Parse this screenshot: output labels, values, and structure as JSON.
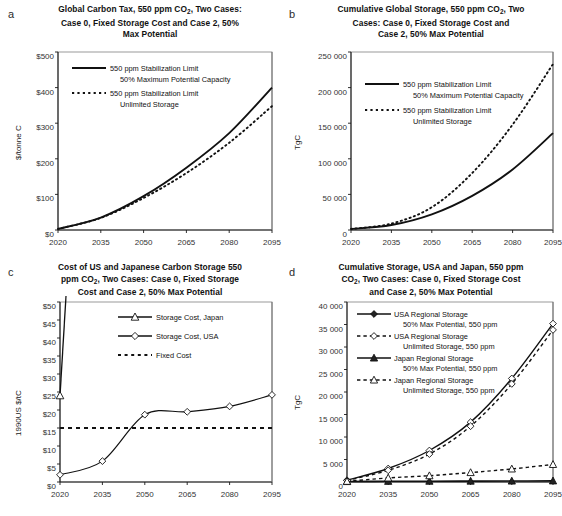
{
  "figure": {
    "panels": [
      "a",
      "b",
      "c",
      "d"
    ]
  },
  "panel_a": {
    "label": "a",
    "title_line1": "Global Carbon Tax, 550 ppm CO",
    "title_sub1": "2",
    "title_line1b": ", Two Cases:",
    "title_line2": "Case 0, Fixed Storage Cost and Case 2, 50%",
    "title_line3": "Max Potential",
    "ylabel": "$/tonne C",
    "yticks": [
      "$0",
      "$100",
      "$200",
      "$300",
      "$400",
      "$500"
    ],
    "xticks": [
      "2020",
      "2035",
      "2050",
      "2065",
      "2080",
      "2095"
    ],
    "legend": [
      {
        "l1": "550 ppm Stabilization Limit",
        "l2": "50% Maximum Potential Capacity",
        "style": "solid"
      },
      {
        "l1": "550 ppm Stabilization Limit",
        "l2": "Unlimited Storage",
        "style": "dashed"
      }
    ]
  },
  "panel_b": {
    "label": "b",
    "title_line1": "Cumulative Global Storage, 550 ppm CO",
    "title_sub1": "2",
    "title_line1b": ", Two",
    "title_line2": "Cases:  Case 0, Fixed Storage Cost and",
    "title_line3": "Case 2, 50% Max Potential",
    "ylabel": "TgC",
    "yticks": [
      "0",
      "50 000",
      "100 000",
      "150 000",
      "200 000",
      "250 000"
    ],
    "xticks": [
      "2020",
      "2035",
      "2050",
      "2065",
      "2080",
      "2095"
    ],
    "legend": [
      {
        "l1": "550 ppm Stabilization Limit",
        "l2": "50% Maximum Potential Capacity",
        "style": "solid"
      },
      {
        "l1": "550 ppm Stabilization Limit",
        "l2": "Unlimited Storage",
        "style": "dashed"
      }
    ]
  },
  "panel_c": {
    "label": "c",
    "title_line1": "Cost of US and Japanese Carbon Storage 550",
    "title_line2a": "ppm CO",
    "title_sub1": "2",
    "title_line2b": ", Two Cases:  Case 0, Fixed Storage",
    "title_line3": "Cost and Case 2, 50% Max Potential",
    "ylabel": "1990US $/tC",
    "yticks": [
      "$0",
      "$5",
      "$10",
      "$15",
      "$20",
      "$25",
      "$30",
      "$35",
      "$40",
      "$45",
      "$50"
    ],
    "xticks": [
      "2020",
      "2035",
      "2050",
      "2065",
      "2080",
      "2095"
    ],
    "legend": [
      {
        "l1": "Storage Cost, Japan",
        "style": "solid-triangle"
      },
      {
        "l1": "Storage Cost, USA",
        "style": "solid-diamond"
      },
      {
        "l1": "Fixed Cost",
        "style": "dashed"
      }
    ]
  },
  "panel_d": {
    "label": "d",
    "title_line1": "Cumulative Storage, USA and Japan, 550 ppm",
    "title_line2a": "CO",
    "title_sub1": "2",
    "title_line2b": ", Two Cases:  Case 0, Fixed Storage Cost",
    "title_line3": "and Case 2, 50% Max Potential",
    "ylabel": "TgC",
    "yticks": [
      "0",
      "5 000",
      "10 000",
      "15 000",
      "20 000",
      "25 000",
      "30 000",
      "35 000",
      "40 000"
    ],
    "xticks": [
      "2020",
      "2035",
      "2050",
      "2065",
      "2080",
      "2095"
    ],
    "legend": [
      {
        "l1": "USA Regional Storage",
        "l2": "50% Max Potential, 550 ppm",
        "style": "solid-diamond-filled"
      },
      {
        "l1": "USA Regional Storage",
        "l2": "Unlimited Storage, 550 ppm",
        "style": "dashed-diamond"
      },
      {
        "l1": "Japan Regional Storage",
        "l2": "50% Max Potential, 550 ppm",
        "style": "solid-triangle-filled"
      },
      {
        "l1": "Japan Regional Storage",
        "l2": "Unlimited Storage, 550 ppm",
        "style": "dashed-triangle"
      }
    ]
  },
  "chart_data": [
    {
      "panel": "a",
      "type": "line",
      "title": "Global Carbon Tax, 550 ppm CO2, Two Cases: Case 0, Fixed Storage Cost and Case 2, 50% Max Potential",
      "xlabel": "",
      "ylabel": "$/tonne C",
      "xlim": [
        2020,
        2095
      ],
      "ylim": [
        0,
        500
      ],
      "grid": false,
      "legend_position": "upper-left",
      "x": [
        2020,
        2035,
        2050,
        2065,
        2080,
        2095
      ],
      "series": [
        {
          "name": "550 ppm Stabilization Limit 50% Maximum Potential Capacity",
          "style": "solid",
          "values": [
            3,
            35,
            95,
            175,
            272,
            400
          ]
        },
        {
          "name": "550 ppm Stabilization Limit Unlimited Storage",
          "style": "dashed",
          "values": [
            3,
            34,
            90,
            160,
            245,
            348
          ]
        }
      ]
    },
    {
      "panel": "b",
      "type": "line",
      "title": "Cumulative Global Storage, 550 ppm CO2, Two Cases: Case 0, Fixed Storage Cost and Case 2, 50% Max Potential",
      "xlabel": "",
      "ylabel": "TgC",
      "xlim": [
        2020,
        2095
      ],
      "ylim": [
        0,
        250000
      ],
      "grid": false,
      "legend_position": "upper-left",
      "x": [
        2020,
        2035,
        2050,
        2065,
        2080,
        2095
      ],
      "series": [
        {
          "name": "550 ppm Stabilization Limit 50% Maximum Potential Capacity",
          "style": "solid",
          "values": [
            1500,
            7000,
            22000,
            48000,
            85000,
            136000
          ]
        },
        {
          "name": "550 ppm Stabilization Limit Unlimited Storage",
          "style": "dashed",
          "values": [
            1500,
            9000,
            32000,
            80000,
            148000,
            233000
          ]
        }
      ]
    },
    {
      "panel": "c",
      "type": "line",
      "title": "Cost of US and Japanese Carbon Storage 550 ppm CO2, Two Cases: Case 0, Fixed Storage Cost and Case 2, 50% Max Potential",
      "xlabel": "",
      "ylabel": "1990US $/tC",
      "xlim": [
        2020,
        2095
      ],
      "ylim": [
        0,
        50
      ],
      "grid": false,
      "legend_position": "upper-right",
      "x": [
        2020,
        2035,
        2050,
        2065,
        2080,
        2095
      ],
      "series": [
        {
          "name": "Storage Cost, Japan",
          "style": "solid-triangle",
          "values": [
            24,
            null,
            null,
            null,
            null,
            null
          ],
          "note": "rises off-scale vertically above 2020"
        },
        {
          "name": "Storage Cost, USA",
          "style": "solid-diamond",
          "values": [
            2,
            5.8,
            18.7,
            19.5,
            21,
            24.2
          ]
        },
        {
          "name": "Fixed Cost",
          "style": "dashed",
          "values": [
            15,
            15,
            15,
            15,
            15,
            15
          ]
        }
      ]
    },
    {
      "panel": "d",
      "type": "line",
      "title": "Cumulative Storage, USA and Japan, 550 ppm CO2, Two Cases: Case 0, Fixed Storage Cost and Case 2, 50% Max Potential",
      "xlabel": "",
      "ylabel": "TgC",
      "xlim": [
        2020,
        2095
      ],
      "ylim": [
        0,
        40000
      ],
      "grid": false,
      "legend_position": "upper-left",
      "x": [
        2020,
        2035,
        2050,
        2065,
        2080,
        2095
      ],
      "series": [
        {
          "name": "USA Regional Storage 50% Max Potential, 550 ppm",
          "style": "solid-diamond-filled",
          "values": [
            400,
            3000,
            7000,
            13300,
            23000,
            35200
          ]
        },
        {
          "name": "USA Regional Storage Unlimited Storage, 550 ppm",
          "style": "dashed-diamond",
          "values": [
            350,
            2600,
            6200,
            12400,
            21800,
            33800
          ]
        },
        {
          "name": "Japan Regional Storage 50% Max Potential, 550 ppm",
          "style": "solid-triangle-filled",
          "values": [
            100,
            150,
            180,
            200,
            220,
            250
          ]
        },
        {
          "name": "Japan Regional Storage Unlimited Storage, 550 ppm",
          "style": "dashed-triangle",
          "values": [
            150,
            900,
            1400,
            2100,
            2900,
            3900
          ]
        }
      ]
    }
  ]
}
